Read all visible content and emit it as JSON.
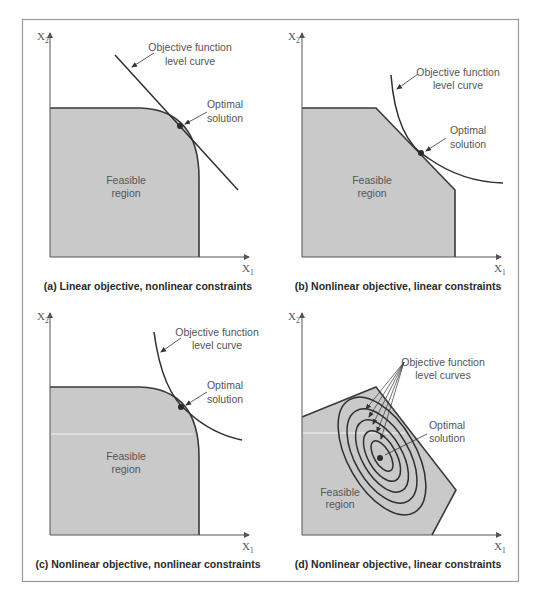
{
  "colors": {
    "feasible_fill": "#c9c9c9",
    "outline": "#3a3a3a",
    "axis": "#555555",
    "label_text": "#555555",
    "caption_text": "#2a2a2a",
    "frame": "#9a9a9a"
  },
  "axes": {
    "x_label": "X",
    "x_sub": "1",
    "y_label": "X",
    "y_sub": "2"
  },
  "panels": [
    {
      "id": "a",
      "caption": "(a) Linear objective, nonlinear constraints",
      "objective_label_line1": "Objective function",
      "objective_label_line2": "level curve",
      "optimal_label_line1": "Optimal",
      "optimal_label_line2": "solution",
      "region_label_line1": "Feasible",
      "region_label_line2": "region"
    },
    {
      "id": "b",
      "caption": "(b) Nonlinear objective, linear constraints",
      "objective_label_line1": "Objective function",
      "objective_label_line2": "level curve",
      "optimal_label_line1": "Optimal",
      "optimal_label_line2": "solution",
      "region_label_line1": "Feasible",
      "region_label_line2": "region"
    },
    {
      "id": "c",
      "caption": "(c) Nonlinear objective, nonlinear constraints",
      "objective_label_line1": "Objective function",
      "objective_label_line2": "level curve",
      "optimal_label_line1": "Optimal",
      "optimal_label_line2": "solution",
      "region_label_line1": "Feasible",
      "region_label_line2": "region"
    },
    {
      "id": "d",
      "caption": "(d) Nonlinear objective, linear constraints",
      "objective_label_line1": "Objective function",
      "objective_label_line2": "level curves",
      "optimal_label_line1": "Optimal",
      "optimal_label_line2": "solution",
      "region_label_line1": "Feasible",
      "region_label_line2": "region"
    }
  ]
}
